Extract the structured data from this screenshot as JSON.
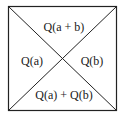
{
  "diagram": {
    "type": "square-with-diagonals",
    "stroke_color": "#222222",
    "background": "#ffffff",
    "regions": {
      "top": "Q(a + b)",
      "left": "Q(a)",
      "right": "Q(b)",
      "bottom": "Q(a) + Q(b)"
    }
  }
}
